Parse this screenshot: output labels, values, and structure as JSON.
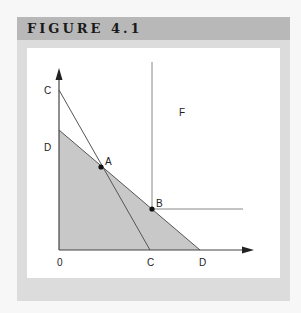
{
  "header": {
    "title": "FIGURE 4.1"
  },
  "colors": {
    "panel_bg": "#dcdcdc",
    "header_bg": "#b8b8b8",
    "shaded_region": "#c8c8c8",
    "line": "#555555"
  },
  "diagram": {
    "axes": {
      "origin_label": "0",
      "x_axis": "horizontal arrow",
      "y_axis": "vertical arrow"
    },
    "labels": {
      "origin": "0",
      "c_y": "C",
      "d_y": "D",
      "c_x": "C",
      "d_x": "D",
      "a": "A",
      "b": "B",
      "f": "F"
    },
    "lines": [
      {
        "name": "CC",
        "from": "C on y-axis",
        "to": "C on x-axis"
      },
      {
        "name": "DD",
        "from": "D on y-axis",
        "to": "D on x-axis",
        "region_below": "shaded"
      }
    ],
    "points": [
      {
        "name": "A",
        "description": "intersection of line CC and line DD"
      },
      {
        "name": "B",
        "description": "point on line DD, corner of region F"
      }
    ],
    "regions": [
      {
        "name": "F",
        "description": "quadrant above and right of B, bounded by vertical and horizontal lines from B"
      }
    ]
  }
}
